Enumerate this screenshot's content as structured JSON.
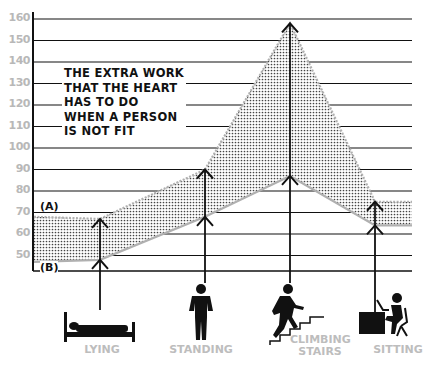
{
  "chart_data": {
    "type": "area",
    "title": "",
    "annotation": "THE EXTRA WORK\nTHAT THE HEART\nHAS TO DO\nWHEN A PERSON\nIS NOT FIT",
    "xlabel": "",
    "ylabel": "",
    "ylim": [
      40,
      165
    ],
    "yticks": [
      50,
      60,
      70,
      80,
      90,
      100,
      110,
      120,
      130,
      140,
      150,
      160
    ],
    "grid": true,
    "categories": [
      "LYING",
      "STANDING",
      "CLIMBING STAIRS",
      "SITTING"
    ],
    "series": [
      {
        "name": "(A) Not fit",
        "values": [
          67,
          90,
          158,
          75
        ],
        "left_edge": 68,
        "right_edge": 75
      },
      {
        "name": "(B) Fit",
        "values": [
          48,
          68,
          87,
          64
        ],
        "left_edge": 47,
        "right_edge": 64
      }
    ],
    "shaded_region": "extra work between (A) and (B)",
    "legend": [
      "(A)",
      "(B)"
    ]
  },
  "labels": {
    "marker_a": "(A)",
    "marker_b": "(B)",
    "categories": [
      "LYING",
      "STANDING",
      "CLIMBING\nSTAIRS",
      "SITTING"
    ]
  },
  "icons": [
    "bed-lying-person-icon",
    "standing-person-icon",
    "climbing-stairs-person-icon",
    "sitting-at-desk-person-icon"
  ],
  "colors": {
    "grid": "#111111",
    "tick_text": "#b8b8b8",
    "category_text": "#bdbdbd",
    "shade": "#555555",
    "edge": "#b0b0b0"
  }
}
